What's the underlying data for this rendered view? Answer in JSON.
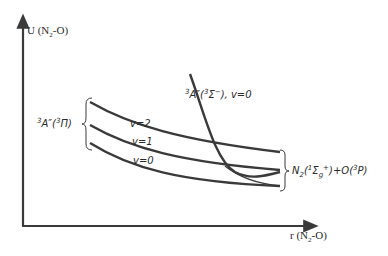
{
  "figure": {
    "y_axis_label": {
      "main": "U (N",
      "sub": "2",
      "tail": "-O)"
    },
    "x_axis_label": {
      "main": "r (N",
      "sub": "2",
      "tail": "-O)"
    },
    "lower_state_label": {
      "sup": "3",
      "main": "A″(",
      "sup2": "3",
      "sym": "Π",
      "close": ")"
    },
    "upper_state_label": {
      "sup": "3",
      "main": "A″(",
      "sup2": "3",
      "sym": "Σ",
      "sup3": "−",
      "close": "), v=0"
    },
    "vibrational_levels": [
      {
        "label": "v=2"
      },
      {
        "label": "v=1"
      },
      {
        "label": "v=0"
      }
    ],
    "asymptote_label": {
      "pre": "N",
      "sub": "2",
      "open": "(",
      "sup": "1",
      "sym": "Σ",
      "sub2": "g",
      "sup2": "+",
      "mid": ")+O(",
      "sup3": "3",
      "tail": "P)"
    },
    "colors": {
      "line": "#3a3a3a",
      "text": "#2a2a2a",
      "background": "#ffffff"
    }
  }
}
